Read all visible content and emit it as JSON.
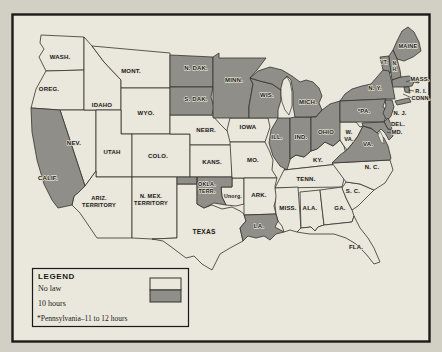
{
  "page": {
    "background": "#d2cfc5"
  },
  "map": {
    "title_hidden": "",
    "colors": {
      "no_law": "#eae7dd",
      "ten_hours": "#8f8e89",
      "line": "#34322c",
      "label": "#1c1b17",
      "halo": "#e4e1d6",
      "frame": "#1b1a17",
      "page": "#d2cfc5"
    },
    "legend": {
      "title": "LEGEND",
      "items": [
        {
          "label": "No law",
          "status": "no_law"
        },
        {
          "label": "10 hours",
          "status": "ten_hours"
        }
      ],
      "footnote": "*Pennsylvania–11 to 12 hours"
    },
    "states": [
      {
        "id": "wash",
        "label": "WASH.",
        "status": "no_law",
        "x": 60,
        "y": 59,
        "fs": 6
      },
      {
        "id": "oreg",
        "label": "OREG.",
        "status": "no_law",
        "x": 49,
        "y": 91,
        "fs": 6
      },
      {
        "id": "calif",
        "label": "CALIF.",
        "status": "ten_hours",
        "x": 48,
        "y": 180,
        "fs": 6
      },
      {
        "id": "nev",
        "label": "NEV.",
        "status": "no_law",
        "x": 74,
        "y": 145,
        "fs": 6
      },
      {
        "id": "idaho",
        "label": "IDAHO",
        "status": "no_law",
        "x": 102,
        "y": 107,
        "fs": 6
      },
      {
        "id": "mont",
        "label": "MONT.",
        "status": "no_law",
        "x": 131,
        "y": 73,
        "fs": 6
      },
      {
        "id": "wyo",
        "label": "WYO.",
        "status": "no_law",
        "x": 146,
        "y": 115,
        "fs": 6
      },
      {
        "id": "utah",
        "label": "UTAH",
        "status": "no_law",
        "x": 112,
        "y": 154,
        "fs": 6
      },
      {
        "id": "colo",
        "label": "COLO.",
        "status": "no_law",
        "x": 158,
        "y": 158,
        "fs": 6
      },
      {
        "id": "ariz",
        "label": "ARIZ.\nTERRITORY",
        "status": "no_law",
        "x": 99,
        "y": 200,
        "fs": 5.6
      },
      {
        "id": "nmex",
        "label": "N. MEX.\nTERRITORY",
        "status": "no_law",
        "x": 151,
        "y": 198,
        "fs": 5.6
      },
      {
        "id": "ndak",
        "label": "N. DAK.",
        "status": "ten_hours",
        "x": 196,
        "y": 70,
        "fs": 6
      },
      {
        "id": "sdak",
        "label": "S. DAK.",
        "status": "ten_hours",
        "x": 196,
        "y": 101,
        "fs": 6
      },
      {
        "id": "nebr",
        "label": "NEBR.",
        "status": "no_law",
        "x": 206,
        "y": 132,
        "fs": 6
      },
      {
        "id": "kans",
        "label": "KANS.",
        "status": "no_law",
        "x": 212,
        "y": 164,
        "fs": 6
      },
      {
        "id": "okla",
        "label": "OKLA.\nTERR.",
        "status": "ten_hours",
        "x": 207,
        "y": 186,
        "fs": 5.4
      },
      {
        "id": "unorg",
        "label": "Unorg.",
        "status": "no_law",
        "x": 233,
        "y": 198,
        "fs": 5.2
      },
      {
        "id": "texas",
        "label": "TEXAS",
        "status": "no_law",
        "x": 204,
        "y": 234,
        "fs": 6.6
      },
      {
        "id": "minn",
        "label": "MINN.",
        "status": "ten_hours",
        "x": 234,
        "y": 82,
        "fs": 6
      },
      {
        "id": "iowa",
        "label": "IOWA",
        "status": "no_law",
        "x": 248,
        "y": 129,
        "fs": 6
      },
      {
        "id": "mo",
        "label": "MO.",
        "status": "no_law",
        "x": 253,
        "y": 162,
        "fs": 6
      },
      {
        "id": "ark",
        "label": "ARK.",
        "status": "no_law",
        "x": 259,
        "y": 197,
        "fs": 6
      },
      {
        "id": "la",
        "label": "LA.",
        "status": "ten_hours",
        "x": 259,
        "y": 228,
        "fs": 6
      },
      {
        "id": "wis",
        "label": "WIS.",
        "status": "ten_hours",
        "x": 267,
        "y": 97,
        "fs": 6
      },
      {
        "id": "ill",
        "label": "ILL.",
        "status": "ten_hours",
        "x": 277,
        "y": 139,
        "fs": 6
      },
      {
        "id": "ind",
        "label": "IND.",
        "status": "ten_hours",
        "x": 301,
        "y": 139,
        "fs": 6
      },
      {
        "id": "mich",
        "label": "MICH.",
        "status": "ten_hours",
        "x": 308,
        "y": 104,
        "fs": 6
      },
      {
        "id": "ohio",
        "label": "OHIO",
        "status": "ten_hours",
        "x": 326,
        "y": 134,
        "fs": 6
      },
      {
        "id": "ky",
        "label": "KY.",
        "status": "no_law",
        "x": 318,
        "y": 162,
        "fs": 6
      },
      {
        "id": "tenn",
        "label": "TENN.",
        "status": "no_law",
        "x": 306,
        "y": 181,
        "fs": 6
      },
      {
        "id": "miss",
        "label": "MISS.",
        "status": "no_law",
        "x": 288,
        "y": 210,
        "fs": 6
      },
      {
        "id": "ala",
        "label": "ALA.",
        "status": "no_law",
        "x": 310,
        "y": 210,
        "fs": 6
      },
      {
        "id": "ga",
        "label": "GA.",
        "status": "no_law",
        "x": 340,
        "y": 210,
        "fs": 6
      },
      {
        "id": "fla",
        "label": "FLA.",
        "status": "no_law",
        "x": 356,
        "y": 249,
        "fs": 6
      },
      {
        "id": "sc",
        "label": "S. C.",
        "status": "no_law",
        "x": 353,
        "y": 193,
        "fs": 6
      },
      {
        "id": "nc",
        "label": "N. C.",
        "status": "no_law",
        "x": 372,
        "y": 169,
        "fs": 6
      },
      {
        "id": "va",
        "label": "VA.",
        "status": "ten_hours",
        "x": 368,
        "y": 146,
        "fs": 6
      },
      {
        "id": "wva",
        "label": "W.\nVA.",
        "status": "no_law",
        "x": 349,
        "y": 134,
        "fs": 5.6
      },
      {
        "id": "maine",
        "label": "MAINE",
        "status": "ten_hours",
        "x": 408,
        "y": 48,
        "fs": 5.6
      },
      {
        "id": "vt",
        "label": "VT.",
        "status": "ten_hours",
        "x": 384,
        "y": 64,
        "fs": 4.8
      },
      {
        "id": "nh",
        "label": "N.\nH.",
        "status": "ten_hours",
        "x": 395,
        "y": 65,
        "fs": 4.8
      },
      {
        "id": "mass",
        "label": "MASS.",
        "status": "ten_hours",
        "x": 420,
        "y": 81,
        "fs": 5.8
      },
      {
        "id": "ri",
        "label": "R. I.",
        "status": "ten_hours",
        "x": 421,
        "y": 93,
        "fs": 5.6
      },
      {
        "id": "conn",
        "label": "CONN.",
        "status": "ten_hours",
        "x": 421,
        "y": 100,
        "fs": 5.6
      },
      {
        "id": "ny",
        "label": "N. Y.",
        "status": "ten_hours",
        "x": 375,
        "y": 90,
        "fs": 6
      },
      {
        "id": "pa",
        "label": "*PA.",
        "status": "ten_hours",
        "x": 364,
        "y": 113,
        "fs": 6
      },
      {
        "id": "nj",
        "label": "N. J.",
        "status": "ten_hours",
        "x": 400,
        "y": 115,
        "fs": 5.8
      },
      {
        "id": "de",
        "label": "DEL.",
        "status": "ten_hours",
        "x": 398,
        "y": 126,
        "fs": 5.8
      },
      {
        "id": "md",
        "label": "MD.",
        "status": "ten_hours",
        "x": 397,
        "y": 134,
        "fs": 5.8
      }
    ]
  }
}
